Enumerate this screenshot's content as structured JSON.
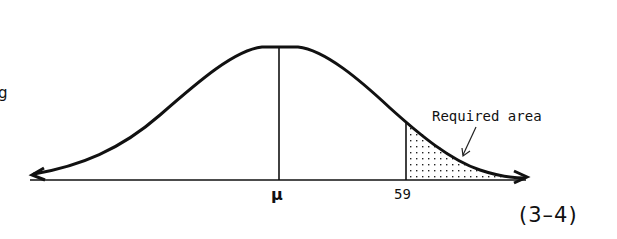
{
  "figure": {
    "number_label": "(3–4)",
    "left_fragment_text": "g",
    "mean_label": "μ",
    "cutoff_label": "59",
    "annotation_label": "Required area"
  },
  "colors": {
    "ink": "#111111",
    "background": "#ffffff"
  },
  "geometry": {
    "baseline_y": 180,
    "mean_x": 279,
    "peak_y": 47,
    "cutoff_x": 406,
    "cutoff_top_y": 121
  }
}
